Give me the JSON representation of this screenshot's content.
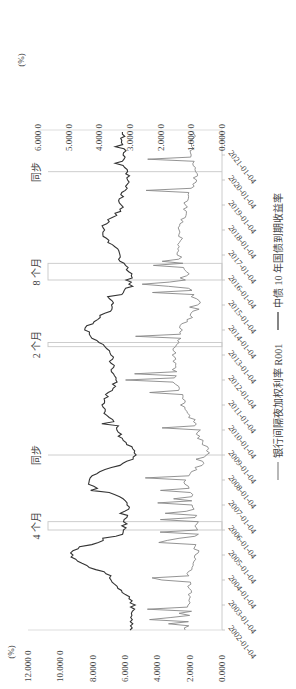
{
  "chart_data": {
    "type": "line",
    "title": "",
    "orientation": "rotated 90° clockwise (time axis runs bottom-to-top)",
    "x": [
      "2002-01-04",
      "2003-01-04",
      "2004-01-04",
      "2005-01-04",
      "2006-01-04",
      "2007-01-04",
      "2008-01-04",
      "2009-01-04",
      "2010-01-04",
      "2011-01-04",
      "2012-01-04",
      "2013-01-04",
      "2014-01-04",
      "2015-01-04",
      "2016-01-04",
      "2017-01-04",
      "2018-01-04",
      "2019-01-04",
      "2020-01-04",
      "2021-01-04"
    ],
    "xlabel": "",
    "y_left": {
      "label": "(%)",
      "ticks": [
        "0.000 0",
        "2.000 0",
        "4.000 0",
        "6.000 0",
        "8.000 0",
        "10.000 0",
        "12.000 0"
      ],
      "ylim": [
        0,
        12
      ]
    },
    "y_right": {
      "label": "(%)",
      "ticks": [
        "0.000 0",
        "1.000 0",
        "2.000 0",
        "3.000 0",
        "4.000 0",
        "5.000 0",
        "6.000 0"
      ],
      "ylim": [
        0,
        6
      ]
    },
    "series": [
      {
        "name": "银行间隔夜加权利率 R001",
        "axis": "left",
        "color": "#888888",
        "values": [
          2.2,
          2.0,
          2.1,
          1.6,
          1.5,
          1.8,
          2.2,
          0.9,
          1.5,
          2.4,
          2.9,
          3.0,
          2.5,
          1.5,
          2.1,
          2.6,
          2.6,
          2.2,
          1.6,
          1.8
        ]
      },
      {
        "name": "中债 10 年国债到期收益率",
        "axis": "right",
        "color": "#333333",
        "values": [
          3.0,
          2.9,
          3.6,
          4.9,
          3.2,
          3.1,
          4.4,
          2.8,
          3.4,
          3.9,
          3.5,
          3.6,
          4.4,
          3.6,
          2.9,
          3.4,
          3.9,
          3.3,
          3.1,
          3.2
        ]
      }
    ],
    "annotations": [
      {
        "label": "4 个月",
        "x_range": [
          "2006-01",
          "2006-05"
        ]
      },
      {
        "label": "同步",
        "x": "2009-01"
      },
      {
        "label": "2 个月",
        "x_range": [
          "2013-05",
          "2013-07"
        ]
      },
      {
        "label": "8 个月",
        "x_range": [
          "2016-01",
          "2016-09"
        ]
      },
      {
        "label": "同步",
        "x": "2020-05"
      }
    ],
    "legend": {
      "position": "bottom",
      "entries": [
        "银行间隔夜加权利率 R001",
        "中债 10 年国债到期收益率"
      ]
    },
    "grid": false
  },
  "labels": {
    "left_unit": "(%)",
    "right_unit": "(%)",
    "legend_r001": "银行间隔夜加权利率 R001",
    "legend_10y": "中债 10 年国债到期收益率"
  }
}
